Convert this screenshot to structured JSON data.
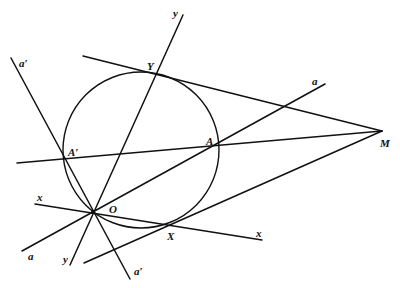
{
  "diagram": {
    "circle": {
      "cx": 141,
      "cy": 150,
      "r": 78
    },
    "points": {
      "O": {
        "x": 93,
        "y": 212,
        "label": "O"
      },
      "Y": {
        "x": 156,
        "y": 74,
        "label": "Y"
      },
      "A": {
        "x": 217,
        "y": 145,
        "label": "A"
      },
      "A_prime": {
        "x": 64,
        "y": 159,
        "label": "A′"
      },
      "X": {
        "x": 172,
        "y": 224,
        "label": "X"
      },
      "M": {
        "x": 382,
        "y": 131,
        "label": "M"
      }
    },
    "lines": [
      {
        "name": "line-y",
        "x1": 70,
        "y1": 265,
        "x2": 183,
        "y2": 15,
        "labels": [
          "y",
          "y"
        ]
      },
      {
        "name": "line-a",
        "x1": 22,
        "y1": 251,
        "x2": 325,
        "y2": 84,
        "labels": [
          "a",
          "a"
        ]
      },
      {
        "name": "line-a-prime",
        "x1": 11,
        "y1": 58,
        "x2": 130,
        "y2": 279,
        "labels": [
          "a′",
          "a′"
        ]
      },
      {
        "name": "line-x",
        "x1": 35,
        "y1": 204,
        "x2": 262,
        "y2": 240,
        "labels": [
          "x",
          "x"
        ]
      },
      {
        "name": "tangent-MY",
        "x1": 83,
        "y1": 56,
        "x2": 382,
        "y2": 131
      },
      {
        "name": "tangent-MX",
        "x1": 84,
        "y1": 263,
        "x2": 382,
        "y2": 131
      },
      {
        "name": "secant-MA-prime",
        "x1": 17,
        "y1": 163,
        "x2": 382,
        "y2": 131
      }
    ],
    "line_labels": {
      "y_top": "y",
      "y_bottom": "y",
      "a_top": "a",
      "a_bottom": "a",
      "a_prime_top": "a′",
      "a_prime_bottom": "a′",
      "x_left": "x",
      "x_right": "x"
    }
  }
}
